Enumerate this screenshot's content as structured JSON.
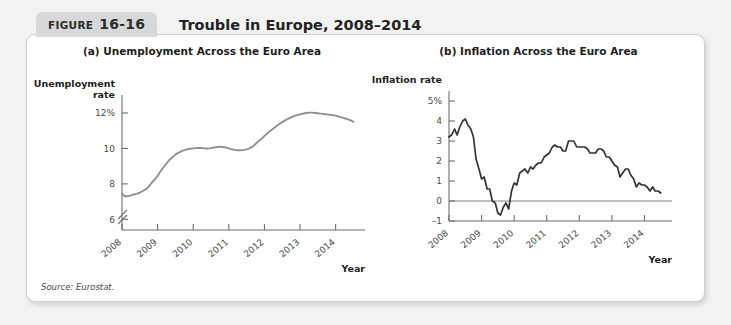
{
  "figure": {
    "tab_word": "FIGURE",
    "tab_number": "16-16",
    "title": "Trouble in Europe, 2008–2014",
    "source": "Source: Eurostat."
  },
  "colors": {
    "tab_background": "#d8d8d8",
    "card_background": "#ffffff",
    "page_background": "#f2f2f2",
    "unemployment_line": "#909090",
    "inflation_line": "#333333",
    "axis": "#6d6d6d",
    "zero_line": "#808080"
  },
  "chart_data": [
    {
      "type": "line",
      "panel": "(a)",
      "title": "(a) Unemployment Across the Euro Area",
      "ylabel": "Unemployment rate",
      "ylabel_lines": [
        "Unemployment",
        "rate"
      ],
      "xlabel": "Year",
      "ytick_labels": [
        "12%",
        "10",
        "8",
        "6"
      ],
      "ytick_values": [
        12,
        10,
        8,
        6
      ],
      "ylim": [
        5.4,
        12.9
      ],
      "axis_break": true,
      "grid": false,
      "legend": "none",
      "xtick_labels": [
        "2008",
        "2009",
        "2010",
        "2011",
        "2012",
        "2013",
        "2014"
      ],
      "xlim": [
        2008,
        2014.6
      ],
      "series": [
        {
          "name": "Euro area unemployment rate",
          "x": [
            2008.0,
            2008.08,
            2008.17,
            2008.25,
            2008.33,
            2008.42,
            2008.5,
            2008.58,
            2008.67,
            2008.75,
            2008.83,
            2008.92,
            2009.0,
            2009.08,
            2009.17,
            2009.25,
            2009.33,
            2009.42,
            2009.5,
            2009.58,
            2009.67,
            2009.75,
            2009.83,
            2009.92,
            2010.0,
            2010.08,
            2010.17,
            2010.25,
            2010.33,
            2010.42,
            2010.5,
            2010.58,
            2010.67,
            2010.75,
            2010.83,
            2010.92,
            2011.0,
            2011.08,
            2011.17,
            2011.25,
            2011.33,
            2011.42,
            2011.5,
            2011.58,
            2011.67,
            2011.75,
            2011.83,
            2011.92,
            2012.0,
            2012.08,
            2012.17,
            2012.25,
            2012.33,
            2012.42,
            2012.5,
            2012.58,
            2012.67,
            2012.75,
            2012.83,
            2012.92,
            2013.0,
            2013.08,
            2013.17,
            2013.25,
            2013.33,
            2013.42,
            2013.5,
            2013.58,
            2013.67,
            2013.75,
            2013.83,
            2013.92,
            2014.0,
            2014.08,
            2014.17,
            2014.25,
            2014.33,
            2014.42,
            2014.5
          ],
          "values": [
            7.45,
            7.3,
            7.3,
            7.35,
            7.4,
            7.45,
            7.5,
            7.6,
            7.7,
            7.85,
            8.05,
            8.25,
            8.45,
            8.7,
            8.95,
            9.15,
            9.35,
            9.5,
            9.65,
            9.75,
            9.85,
            9.9,
            9.95,
            9.98,
            10.0,
            10.02,
            10.03,
            10.02,
            10.0,
            10.0,
            10.02,
            10.05,
            10.08,
            10.1,
            10.08,
            10.05,
            10.0,
            9.95,
            9.92,
            9.9,
            9.9,
            9.92,
            9.95,
            10.0,
            10.1,
            10.25,
            10.4,
            10.55,
            10.7,
            10.85,
            11.0,
            11.12,
            11.25,
            11.38,
            11.48,
            11.58,
            11.68,
            11.75,
            11.82,
            11.88,
            11.92,
            11.96,
            12.0,
            12.02,
            12.02,
            12.0,
            11.98,
            11.96,
            11.94,
            11.92,
            11.9,
            11.88,
            11.85,
            11.8,
            11.75,
            11.7,
            11.65,
            11.58,
            11.5
          ]
        }
      ]
    },
    {
      "type": "line",
      "panel": "(b)",
      "title": "(b) Inflation Across the Euro Area",
      "ylabel": "Inflation rate",
      "ylabel_lines": [
        "Inflation rate"
      ],
      "xlabel": "Year",
      "ytick_labels": [
        "5%",
        "4",
        "3",
        "2",
        "1",
        "0",
        "–1"
      ],
      "ytick_values": [
        5,
        4,
        3,
        2,
        1,
        0,
        -1
      ],
      "ylim": [
        -1,
        5.4
      ],
      "axis_break": false,
      "grid": false,
      "zero_line": true,
      "legend": "none",
      "xtick_labels": [
        "2008",
        "2009",
        "2010",
        "2011",
        "2012",
        "2013",
        "2014"
      ],
      "xlim": [
        2008,
        2014.6
      ],
      "series": [
        {
          "name": "Euro area inflation rate",
          "x": [
            2008.0,
            2008.08,
            2008.17,
            2008.25,
            2008.33,
            2008.42,
            2008.5,
            2008.58,
            2008.67,
            2008.75,
            2008.83,
            2008.92,
            2009.0,
            2009.08,
            2009.17,
            2009.25,
            2009.33,
            2009.42,
            2009.5,
            2009.58,
            2009.67,
            2009.75,
            2009.83,
            2009.92,
            2010.0,
            2010.08,
            2010.17,
            2010.25,
            2010.33,
            2010.42,
            2010.5,
            2010.58,
            2010.67,
            2010.75,
            2010.83,
            2010.92,
            2011.0,
            2011.08,
            2011.17,
            2011.25,
            2011.33,
            2011.42,
            2011.5,
            2011.58,
            2011.67,
            2011.75,
            2011.83,
            2011.92,
            2012.0,
            2012.08,
            2012.17,
            2012.25,
            2012.33,
            2012.42,
            2012.5,
            2012.58,
            2012.67,
            2012.75,
            2012.83,
            2012.92,
            2013.0,
            2013.08,
            2013.17,
            2013.25,
            2013.33,
            2013.42,
            2013.5,
            2013.58,
            2013.67,
            2013.75,
            2013.83,
            2013.92,
            2014.0,
            2014.08,
            2014.17,
            2014.25,
            2014.33,
            2014.42,
            2014.5
          ],
          "values": [
            3.2,
            3.3,
            3.6,
            3.3,
            3.7,
            4.0,
            4.1,
            3.8,
            3.6,
            3.2,
            2.1,
            1.6,
            1.1,
            1.2,
            0.6,
            0.6,
            0.0,
            -0.1,
            -0.6,
            -0.7,
            -0.3,
            -0.1,
            -0.4,
            0.5,
            0.9,
            0.8,
            1.4,
            1.5,
            1.6,
            1.4,
            1.7,
            1.6,
            1.8,
            1.9,
            1.9,
            2.2,
            2.3,
            2.4,
            2.7,
            2.8,
            2.7,
            2.7,
            2.5,
            2.5,
            3.0,
            3.0,
            3.0,
            2.7,
            2.7,
            2.7,
            2.7,
            2.6,
            2.4,
            2.4,
            2.4,
            2.6,
            2.6,
            2.5,
            2.2,
            2.2,
            2.0,
            1.8,
            1.7,
            1.2,
            1.4,
            1.6,
            1.6,
            1.3,
            1.1,
            0.7,
            0.9,
            0.8,
            0.8,
            0.7,
            0.5,
            0.7,
            0.5,
            0.5,
            0.4
          ]
        }
      ]
    }
  ]
}
